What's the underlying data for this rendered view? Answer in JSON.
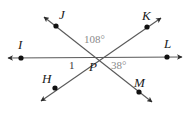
{
  "figure": {
    "type": "geometry-diagram",
    "width": 192,
    "height": 126,
    "background_color": "#ffffff",
    "line_color": "#4a4a4a",
    "point_color": "#111111",
    "label_color": "#1a1a1a",
    "angle_label_color": "#8a8a8a"
  },
  "vertex": {
    "name": "P",
    "label": "P",
    "x": 94,
    "y": 57,
    "label_x": 89,
    "label_y": 60
  },
  "points": [
    {
      "name": "J",
      "label": "J",
      "x": 56,
      "y": 26,
      "label_x": 59,
      "label_y": 8
    },
    {
      "name": "K",
      "label": "K",
      "x": 147,
      "y": 27,
      "label_x": 142,
      "label_y": 9
    },
    {
      "name": "I",
      "label": "I",
      "x": 21,
      "y": 58,
      "label_x": 18,
      "label_y": 38
    },
    {
      "name": "L",
      "label": "L",
      "x": 167,
      "y": 57,
      "label_x": 164,
      "label_y": 37
    },
    {
      "name": "H",
      "label": "H",
      "x": 55,
      "y": 88,
      "label_x": 42,
      "label_y": 72
    },
    {
      "name": "M",
      "label": "M",
      "x": 139,
      "y": 92,
      "label_x": 134,
      "label_y": 76
    }
  ],
  "lines": [
    {
      "name": "line-I-L",
      "from": "I",
      "to": "L",
      "x1": 8,
      "y1": 58,
      "x2": 182,
      "y2": 57
    },
    {
      "name": "line-J-M",
      "from": "J",
      "to": "M",
      "x1": 44,
      "y1": 17,
      "x2": 152,
      "y2": 102
    },
    {
      "name": "line-H-K",
      "from": "H",
      "to": "K",
      "x1": 41,
      "y1": 101,
      "x2": 161,
      "y2": 18
    }
  ],
  "angles": [
    {
      "name": "angle-JPK",
      "label": "108°",
      "value": 108,
      "unit": "degrees",
      "x": 84,
      "y": 34
    },
    {
      "name": "angle-LPM",
      "label": "38°",
      "value": 38,
      "unit": "degrees",
      "x": 111,
      "y": 60
    },
    {
      "name": "angle-1",
      "label": "1",
      "value": null,
      "unit": "number",
      "x": 69,
      "y": 60
    }
  ]
}
